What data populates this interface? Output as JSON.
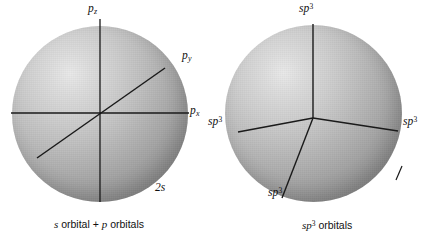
{
  "figure": {
    "background_color": "#ffffff",
    "line_color": "#1a1a1a",
    "sphere_light_color": "#e9e9e9",
    "sphere_shadow_color": "#7d7d7d"
  },
  "left_panel": {
    "caption_prefix": "s",
    "caption_middle": " orbital + ",
    "caption_p": "p",
    "caption_suffix": " orbitals",
    "caption_full": "s orbital + p orbitals",
    "sphere_name": "s-orbital-sphere",
    "labels": [
      {
        "id": "pz",
        "base": "p",
        "sub": "z",
        "sup": "",
        "text": "pz"
      },
      {
        "id": "py",
        "base": "p",
        "sub": "y",
        "sup": "",
        "text": "py"
      },
      {
        "id": "px",
        "base": "p",
        "sub": "x",
        "sup": "",
        "text": "px"
      },
      {
        "id": "2s",
        "base": "2s",
        "sub": "",
        "sup": "",
        "text": "2s"
      }
    ]
  },
  "right_panel": {
    "caption_sp": "sp",
    "caption_exp": "3",
    "caption_suffix": " orbitals",
    "caption_full": "sp3 orbitals",
    "sphere_name": "sp3-orbital-sphere",
    "labels": [
      {
        "id": "sp3-top",
        "base": "sp",
        "sup": "3",
        "text": "sp3"
      },
      {
        "id": "sp3-left",
        "base": "sp",
        "sup": "3",
        "text": "sp3"
      },
      {
        "id": "sp3-right",
        "base": "sp",
        "sup": "3",
        "text": "sp3"
      },
      {
        "id": "sp3-bottom",
        "base": "sp",
        "sup": "3",
        "text": "sp3"
      }
    ]
  }
}
